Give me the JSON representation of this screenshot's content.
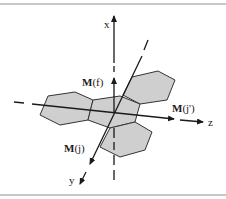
{
  "figure": {
    "type": "3D coordinate axes with hexagonal molecular planes",
    "axes": {
      "x": {
        "label": "x"
      },
      "y": {
        "label": "y"
      },
      "z": {
        "label": "z"
      }
    },
    "vectors": {
      "mf": {
        "label_bold": "M",
        "label_rest": "(f)"
      },
      "mjp": {
        "label_bold": "M",
        "label_rest": "(j')"
      },
      "mj": {
        "label_bold": "M",
        "label_rest": "(j)"
      }
    },
    "hexagon_count": 4,
    "colors": {
      "hex_fill": "#cfcfcf",
      "line": "#1a1a1a",
      "border": "#b5b5b5"
    }
  }
}
